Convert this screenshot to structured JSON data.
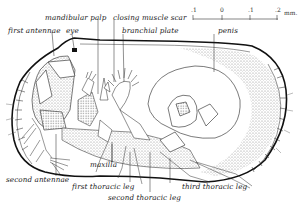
{
  "diagram": {
    "labels": {
      "first_antennae": "first antennae",
      "eye": "eye",
      "mandibular_palp": "mandibular palp",
      "closing_muscle_scar": "closing muscle scar",
      "branchial_plate": "branchial plate",
      "penis": "penis",
      "second_antennae": "second antennae",
      "maxilla": "maxilla",
      "first_thoracic_leg": "first thoracic leg",
      "second_thoracic_leg": "second thoracic leg",
      "third_thoracic_leg": "third thoracic leg"
    },
    "scale_bar": {
      "ticks": [
        ".1",
        "0",
        ".1",
        ".2"
      ],
      "unit": "mm."
    },
    "colors": {
      "ink": "#1a1a1a",
      "stipple": "#bdbdbd",
      "background": "#ffffff"
    }
  }
}
